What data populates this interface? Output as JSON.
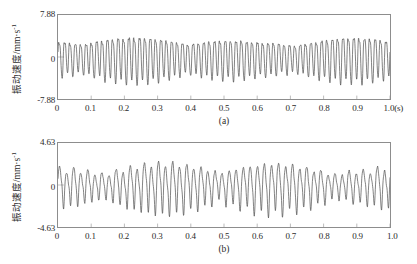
{
  "figure": {
    "background": "#ffffff",
    "line_color": "#4a4a4a",
    "axis_color": "#8d8d8d"
  },
  "chart_data": [
    {
      "type": "line",
      "id": "panel-a",
      "title": "",
      "caption": "(a)",
      "xlabel": "",
      "ylabel": "振动速度/mm·s",
      "ylabel_exponent": "-1",
      "xunit": "(s)",
      "xlim": [
        0,
        1.0
      ],
      "ylim": [
        -7.88,
        7.88
      ],
      "grid": false,
      "legend": null,
      "y_ticks": [
        "7.88",
        "0",
        "-7.88"
      ],
      "y_tick_values": [
        7.88,
        0,
        -7.88
      ],
      "x_ticks": [
        "0",
        "0.1",
        "0.2",
        "0.3",
        "0.4",
        "0.5",
        "0.6",
        "0.7",
        "0.8",
        "0.9",
        "1.0(s)"
      ],
      "x_tick_values": [
        0,
        0.1,
        0.2,
        0.3,
        0.4,
        0.5,
        0.6,
        0.7,
        0.8,
        0.9,
        1.0
      ],
      "signal": {
        "description": "Amplitude-modulated vibration velocity waveform (beating), peak envelope ~0.62 of full scale",
        "sample_count": 1400,
        "carrier_hz": 62,
        "carrier_amplitude": 4.3,
        "modulation": [
          {
            "hz": 3.1,
            "depth": 0.33,
            "phase": 0.9
          },
          {
            "hz": 1.35,
            "depth": 0.22,
            "phase": 2.1
          }
        ],
        "harmonics": [
          {
            "hz": 124,
            "amplitude": 0.85,
            "phase": 1.2
          },
          {
            "hz": 186,
            "amplitude": 0.35,
            "phase": 0.4
          },
          {
            "hz": 31,
            "amplitude": 0.55,
            "phase": 2.6
          }
        ],
        "noise_amplitude": 0.22,
        "seed": 1777
      }
    },
    {
      "type": "line",
      "id": "panel-b",
      "title": "",
      "caption": "(b)",
      "xlabel": "",
      "ylabel": "振动速度/mm·s",
      "ylabel_exponent": "-1",
      "xunit": "(s)",
      "xlim": [
        0,
        1.0
      ],
      "ylim": [
        -4.63,
        4.63
      ],
      "grid": false,
      "legend": null,
      "y_ticks": [
        "4.63",
        "0",
        "-4.63"
      ],
      "y_tick_values": [
        4.63,
        0,
        -4.63
      ],
      "x_ticks": [
        "0",
        "0.1",
        "0.2",
        "0.3",
        "0.4",
        "0.5",
        "0.6",
        "0.7",
        "0.8",
        "0.9",
        "1.0"
      ],
      "x_tick_values": [
        0,
        0.1,
        0.2,
        0.3,
        0.4,
        0.5,
        0.6,
        0.7,
        0.8,
        0.9,
        1.0
      ],
      "signal": {
        "description": "Amplitude-modulated vibration velocity waveform (beating), lower carrier frequency, peak envelope ~0.82 of full scale",
        "sample_count": 1400,
        "carrier_hz": 47,
        "carrier_amplitude": 2.6,
        "modulation": [
          {
            "hz": 2.85,
            "depth": 0.46,
            "phase": 0.35
          },
          {
            "hz": 1.05,
            "depth": 0.25,
            "phase": 1.6
          }
        ],
        "harmonics": [
          {
            "hz": 94,
            "amplitude": 0.62,
            "phase": 0.8
          },
          {
            "hz": 141,
            "amplitude": 0.28,
            "phase": 2.3
          },
          {
            "hz": 23,
            "amplitude": 0.42,
            "phase": 1.1
          }
        ],
        "noise_amplitude": 0.18,
        "seed": 4242
      }
    }
  ]
}
